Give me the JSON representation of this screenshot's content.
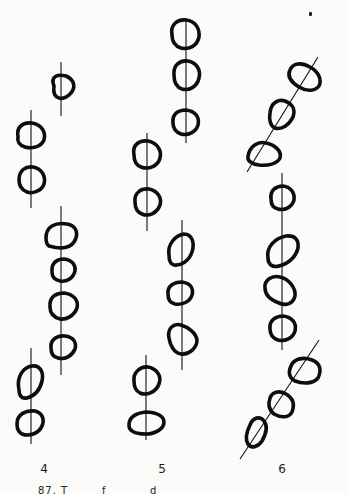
{
  "figure": {
    "columns": [
      {
        "label": "4"
      },
      {
        "label": "5"
      },
      {
        "label": "6"
      }
    ],
    "caption_fragments": [
      "87. T",
      "f",
      "d"
    ],
    "colors": {
      "ink": "#0d0d0d",
      "paper": "#fbfbfa"
    }
  }
}
